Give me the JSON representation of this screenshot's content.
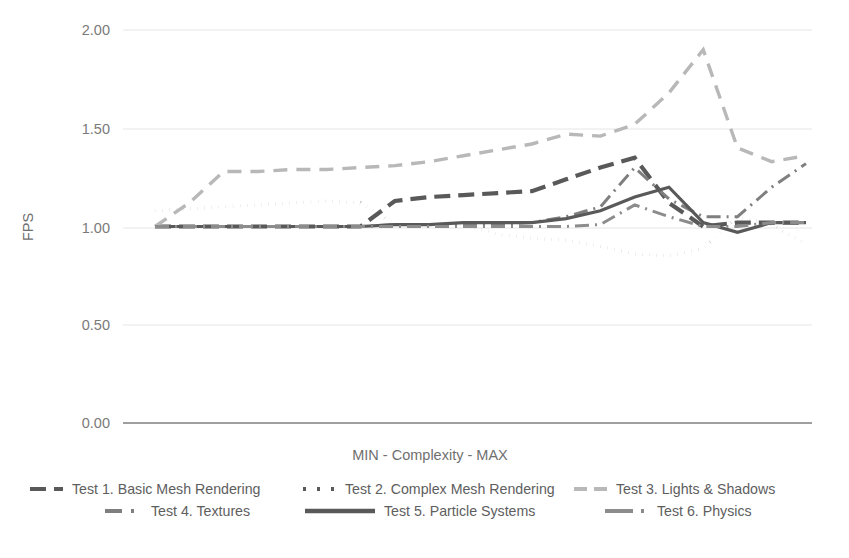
{
  "chart_data": {
    "type": "line",
    "title": "",
    "subtitle": "",
    "xlabel": "MIN - Complexity - MAX",
    "ylabel": "FPS",
    "ylim": [
      0.0,
      2.0
    ],
    "yticks": [
      "0.00",
      "0.50",
      "1.00",
      "1.50",
      "2.00"
    ],
    "ytick_values": [
      0.0,
      0.5,
      1.0,
      1.5,
      2.0
    ],
    "xticks": [],
    "grid": true,
    "legend_position": "bottom",
    "x": [
      1,
      2,
      3,
      4,
      5,
      6,
      7,
      8,
      9,
      10,
      11,
      12,
      13,
      14,
      15,
      16,
      17,
      18,
      19,
      20
    ],
    "series": [
      {
        "name": "Test 1. Basic Mesh Rendering",
        "style": "dashed",
        "color": "#595959",
        "width": 4.2,
        "dasharray": "16 8",
        "values": [
          1.0,
          1.0,
          1.0,
          1.0,
          1.0,
          1.0,
          1.0,
          1.13,
          1.15,
          1.16,
          1.17,
          1.18,
          1.24,
          1.3,
          1.35,
          1.12,
          1.0,
          1.02,
          1.02,
          1.02
        ]
      },
      {
        "name": "Test 2. Complex Mesh Rendering",
        "style": "dotted",
        "color": "#595959",
        "width": 3.4,
        "dasharray": "0.1 7",
        "values": [
          1.08,
          1.09,
          1.1,
          1.11,
          1.12,
          1.13,
          1.12,
          1.01,
          1.01,
          1.01,
          0.96,
          0.94,
          0.93,
          0.9,
          0.86,
          0.85,
          0.89,
          1.05,
          1.01,
          0.91
        ]
      },
      {
        "name": "Test 3. Lights & Shadows",
        "style": "dashed",
        "color": "#b8b8b8",
        "width": 3.4,
        "dasharray": "14 9",
        "values": [
          1.0,
          1.12,
          1.28,
          1.28,
          1.29,
          1.29,
          1.3,
          1.31,
          1.33,
          1.36,
          1.39,
          1.42,
          1.47,
          1.46,
          1.52,
          1.68,
          1.9,
          1.4,
          1.33,
          1.36
        ]
      },
      {
        "name": "Test 4. Textures",
        "style": "dashdot",
        "color": "#7f7f7f",
        "width": 3.0,
        "dasharray": "14 6 2 6",
        "values": [
          1.0,
          1.0,
          1.0,
          1.0,
          1.0,
          1.0,
          1.0,
          1.01,
          1.01,
          1.01,
          1.01,
          1.02,
          1.05,
          1.1,
          1.3,
          1.14,
          1.05,
          1.05,
          1.2,
          1.32
        ]
      },
      {
        "name": "Test 5. Particle Systems",
        "style": "solid",
        "color": "#595959",
        "width": 3.2,
        "dasharray": "",
        "values": [
          1.0,
          1.0,
          1.0,
          1.0,
          1.0,
          1.0,
          1.0,
          1.01,
          1.01,
          1.02,
          1.02,
          1.02,
          1.04,
          1.08,
          1.15,
          1.2,
          1.02,
          0.97,
          1.02,
          1.02
        ]
      },
      {
        "name": "Test 6. Physics",
        "style": "dashdot",
        "color": "#8c8c8c",
        "width": 3.0,
        "dasharray": "14 6 2 6",
        "values": [
          1.0,
          1.0,
          1.0,
          1.0,
          1.0,
          1.0,
          1.0,
          1.0,
          1.0,
          1.0,
          1.0,
          1.0,
          1.0,
          1.01,
          1.11,
          1.05,
          1.0,
          1.0,
          1.02,
          1.02
        ]
      }
    ]
  },
  "legend": {
    "items": [
      {
        "label": "Test 1. Basic Mesh Rendering",
        "marker": "dashed-dark"
      },
      {
        "label": "Test 2. Complex Mesh Rendering",
        "marker": "dotted-dark"
      },
      {
        "label": "Test 3. Lights & Shadows",
        "marker": "dashed-light"
      },
      {
        "label": "Test 4. Textures",
        "marker": "dashdot-mid"
      },
      {
        "label": "Test 5. Particle Systems",
        "marker": "solid-dark"
      },
      {
        "label": "Test 6. Physics",
        "marker": "dashdot-grey"
      }
    ]
  },
  "colors": {
    "grid": "#e6e6e6",
    "axis": "#7f7f7f",
    "text": "#6b6b6b",
    "dark": "#595959",
    "mid": "#7f7f7f",
    "light": "#b8b8b8"
  }
}
